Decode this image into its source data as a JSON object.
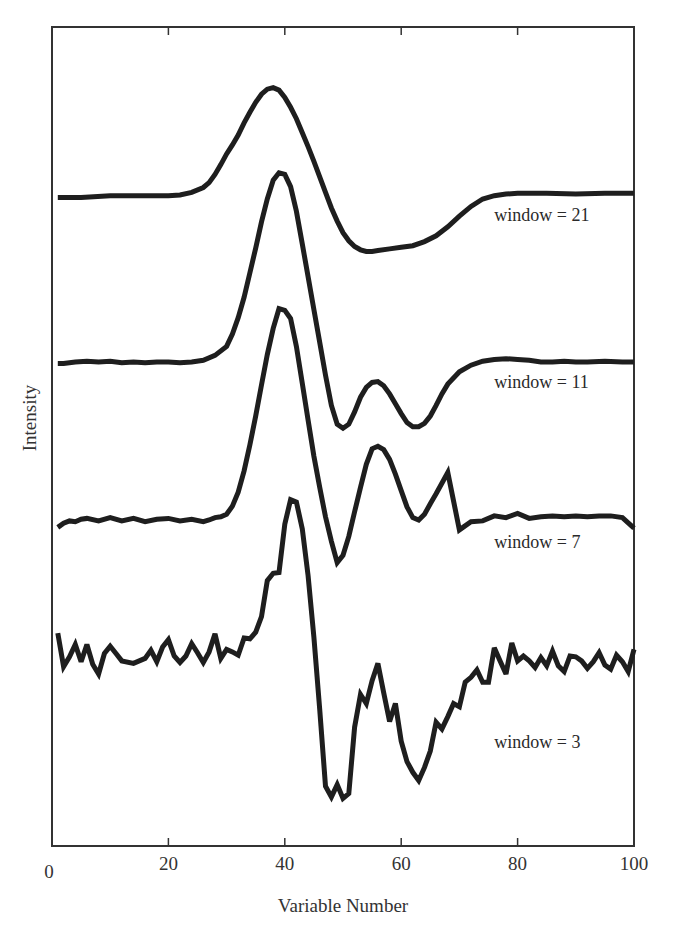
{
  "chart_data": {
    "type": "line",
    "title": "",
    "xlabel": "Variable Number",
    "ylabel": "Intensity",
    "xlim": [
      0,
      100
    ],
    "ylim": [
      0,
      100
    ],
    "xticks": [
      0,
      20,
      40,
      60,
      80,
      100
    ],
    "xtick_labels": [
      "0",
      "20",
      "40",
      "60",
      "80",
      "100"
    ],
    "yticks_shown": false,
    "grid": false,
    "legend": "inline labels",
    "series": [
      {
        "name": "window = 21",
        "label_pos": [
          76,
          76.3
        ],
        "x": [
          1,
          5,
          10,
          15,
          20,
          22,
          24,
          26,
          27,
          28,
          29,
          30,
          31,
          32,
          33,
          34,
          35,
          36,
          37,
          38,
          39,
          40,
          41,
          42,
          43,
          44,
          45,
          46,
          47,
          48,
          49,
          50,
          51,
          52,
          53,
          54,
          55,
          56,
          58,
          60,
          62,
          64,
          66,
          68,
          70,
          72,
          74,
          76,
          78,
          80,
          85,
          90,
          95,
          100
        ],
        "y": [
          79.2,
          79.2,
          79.4,
          79.4,
          79.4,
          79.5,
          79.8,
          80.4,
          81.0,
          82.0,
          83.2,
          84.5,
          85.6,
          86.8,
          88.3,
          89.6,
          90.8,
          91.8,
          92.4,
          92.6,
          92.3,
          91.4,
          90.2,
          88.8,
          87.1,
          85.4,
          83.6,
          81.7,
          79.8,
          77.9,
          76.3,
          74.9,
          73.9,
          73.2,
          72.8,
          72.6,
          72.6,
          72.7,
          72.9,
          73.1,
          73.3,
          73.8,
          74.5,
          75.6,
          76.9,
          78.1,
          79.0,
          79.4,
          79.6,
          79.7,
          79.7,
          79.6,
          79.7,
          79.7
        ]
      },
      {
        "name": "window = 11",
        "label_pos": [
          76,
          55.9
        ],
        "x": [
          1,
          2,
          4,
          6,
          8,
          10,
          12,
          14,
          16,
          18,
          20,
          22,
          24,
          26,
          28,
          30,
          31,
          32,
          33,
          34,
          35,
          36,
          37,
          38,
          39,
          40,
          41,
          42,
          43,
          44,
          45,
          46,
          47,
          48,
          49,
          50,
          51,
          52,
          53,
          54,
          55,
          56,
          57,
          58,
          59,
          60,
          61,
          62,
          63,
          64,
          65,
          66,
          67,
          68,
          70,
          72,
          74,
          76,
          78,
          80,
          82,
          84,
          86,
          88,
          90,
          92,
          95,
          98,
          100
        ],
        "y": [
          58.9,
          58.9,
          59.1,
          59.2,
          59.1,
          59.2,
          59.0,
          59.1,
          59.0,
          59.1,
          59.1,
          59.0,
          59.1,
          59.3,
          59.9,
          61.0,
          62.5,
          64.5,
          67.0,
          70.0,
          73.0,
          76.2,
          79.0,
          81.3,
          82.2,
          82.0,
          80.5,
          77.5,
          73.5,
          69.5,
          65.5,
          61.5,
          57.5,
          53.8,
          51.5,
          51.0,
          51.5,
          53.0,
          54.8,
          56.0,
          56.6,
          56.7,
          56.2,
          55.2,
          54.0,
          52.8,
          51.7,
          51.2,
          51.2,
          51.6,
          52.5,
          53.8,
          55.2,
          56.4,
          57.9,
          58.7,
          59.2,
          59.4,
          59.5,
          59.4,
          59.3,
          59.1,
          59.1,
          59.2,
          59.1,
          59.1,
          59.2,
          59.1,
          59.1
        ]
      },
      {
        "name": "window = 7",
        "label_pos": [
          76,
          36.4
        ],
        "x": [
          1,
          2,
          3,
          4,
          5,
          6,
          8,
          10,
          12,
          14,
          16,
          18,
          20,
          22,
          24,
          26,
          27,
          28,
          29,
          30,
          31,
          32,
          33,
          34,
          35,
          36,
          37,
          38,
          39,
          40,
          41,
          42,
          43,
          44,
          45,
          46,
          47,
          48,
          49,
          50,
          51,
          52,
          53,
          54,
          55,
          56,
          57,
          58,
          59,
          60,
          61,
          62,
          63,
          64,
          65,
          66,
          68,
          70,
          72,
          74,
          76,
          78,
          80,
          82,
          84,
          86,
          88,
          90,
          92,
          94,
          96,
          98,
          100
        ],
        "y": [
          38.9,
          39.4,
          39.7,
          39.6,
          39.9,
          40.0,
          39.7,
          40.1,
          39.7,
          40.0,
          39.6,
          39.9,
          40.0,
          39.7,
          39.9,
          39.6,
          39.8,
          40.1,
          40.2,
          40.5,
          41.5,
          43.2,
          45.8,
          49.0,
          52.5,
          56.3,
          60.0,
          63.2,
          65.6,
          65.4,
          64.4,
          61.0,
          56.5,
          52.0,
          47.6,
          43.8,
          40.2,
          37.2,
          34.6,
          35.5,
          37.8,
          40.8,
          43.8,
          46.6,
          48.5,
          48.8,
          48.4,
          47.2,
          45.4,
          43.4,
          41.4,
          40.1,
          39.8,
          40.5,
          41.8,
          43.0,
          45.6,
          38.6,
          39.6,
          39.7,
          40.3,
          40.1,
          40.6,
          40.0,
          40.2,
          40.3,
          40.2,
          40.3,
          40.2,
          40.3,
          40.3,
          40.1,
          38.8
        ]
      },
      {
        "name": "window = 3",
        "label_pos": [
          76,
          12.0
        ],
        "x": [
          1,
          2,
          3,
          4,
          5,
          6,
          7,
          8,
          9,
          10,
          11,
          12,
          14,
          16,
          17,
          18,
          19,
          20,
          21,
          22,
          23,
          24,
          25,
          26,
          27,
          28,
          29,
          30,
          31,
          32,
          33,
          34,
          35,
          36,
          37,
          38,
          39,
          40,
          41,
          42,
          43,
          44,
          45,
          46,
          47,
          48,
          49,
          50,
          51,
          52,
          53,
          54,
          55,
          56,
          57,
          58,
          59,
          60,
          61,
          62,
          63,
          64,
          65,
          66,
          67,
          68,
          69,
          70,
          71,
          72,
          73,
          74,
          75,
          76,
          77,
          78,
          79,
          80,
          81,
          82,
          83,
          84,
          85,
          86,
          87,
          88,
          89,
          90,
          91,
          92,
          93,
          94,
          95,
          96,
          97,
          98,
          99,
          100
        ],
        "y": [
          26.0,
          21.9,
          23.1,
          24.6,
          22.5,
          24.6,
          22.2,
          21.0,
          23.5,
          24.4,
          23.5,
          22.6,
          22.3,
          22.9,
          23.9,
          22.5,
          24.3,
          25.2,
          23.2,
          22.4,
          23.2,
          24.7,
          23.6,
          22.4,
          23.7,
          25.9,
          22.9,
          24.0,
          23.7,
          23.3,
          25.4,
          25.3,
          26.1,
          28.0,
          32.4,
          33.3,
          33.4,
          39.3,
          42.3,
          42.0,
          38.7,
          33.0,
          25.5,
          16.7,
          7.3,
          6.0,
          7.5,
          5.8,
          6.4,
          14.5,
          18.5,
          17.4,
          20.2,
          22.3,
          18.7,
          15.2,
          17.4,
          12.8,
          10.3,
          9.0,
          8.0,
          9.6,
          11.6,
          15.1,
          14.3,
          15.8,
          17.4,
          17.0,
          20.0,
          20.6,
          21.5,
          20.0,
          20.0,
          24.2,
          22.6,
          21.0,
          24.8,
          22.6,
          23.2,
          22.6,
          21.8,
          23.0,
          22.0,
          23.8,
          22.0,
          21.3,
          23.2,
          23.1,
          22.6,
          21.7,
          22.5,
          23.6,
          22.1,
          21.6,
          23.3,
          22.5,
          21.3,
          24.0
        ]
      }
    ]
  },
  "axes": {
    "x_label": "Variable Number",
    "y_label": "Intensity",
    "x_tick_labels": [
      "0",
      "20",
      "40",
      "60",
      "80",
      "100"
    ]
  },
  "legend": {
    "labels": [
      "window = 21",
      "window = 11",
      "window = 7",
      "window = 3"
    ]
  }
}
